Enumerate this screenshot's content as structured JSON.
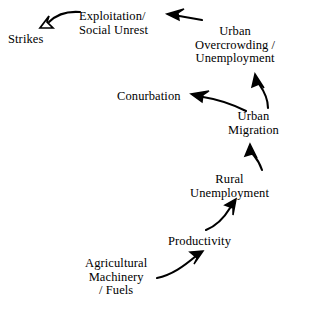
{
  "diagram": {
    "type": "causal-flow-diagram",
    "background_color": "#ffffff",
    "stroke_color": "#000000",
    "nodes": [
      {
        "id": "strikes",
        "lines": [
          "Strikes"
        ]
      },
      {
        "id": "exploitation",
        "lines": [
          "Exploitation/",
          "Social Unrest"
        ]
      },
      {
        "id": "urban_overcrowding",
        "lines": [
          "Urban",
          "Overcrowding /",
          "Unemployment"
        ]
      },
      {
        "id": "conurbation",
        "lines": [
          "Conurbation"
        ]
      },
      {
        "id": "urban_migration",
        "lines": [
          "Urban",
          "Migration"
        ]
      },
      {
        "id": "rural_unemployment",
        "lines": [
          "Rural",
          "Unemployment"
        ]
      },
      {
        "id": "productivity",
        "lines": [
          "Productivity"
        ]
      },
      {
        "id": "agricultural",
        "lines": [
          "Agricultural",
          "Machinery",
          "/ Fuels"
        ]
      }
    ],
    "edges": [
      {
        "id": "agricultural-to-productivity",
        "from": "Agricultural Machinery / Fuels",
        "to": "Productivity"
      },
      {
        "id": "productivity-to-rural-unemployment",
        "from": "Productivity",
        "to": "Rural Unemployment"
      },
      {
        "id": "rural-unemployment-to-urban-migration",
        "from": "Rural Unemployment",
        "to": "Urban Migration"
      },
      {
        "id": "urban-migration-to-urban-overcrowding",
        "from": "Urban Migration",
        "to": "Urban Overcrowding / Unemployment"
      },
      {
        "id": "urban-migration-to-conurbation",
        "from": "Urban Migration",
        "to": "Conurbation"
      },
      {
        "id": "urban-overcrowding-to-exploitation",
        "from": "Urban Overcrowding / Unemployment",
        "to": "Exploitation/ Social Unrest"
      },
      {
        "id": "exploitation-to-strikes",
        "from": "Exploitation/ Social Unrest",
        "to": "Strikes"
      }
    ]
  }
}
